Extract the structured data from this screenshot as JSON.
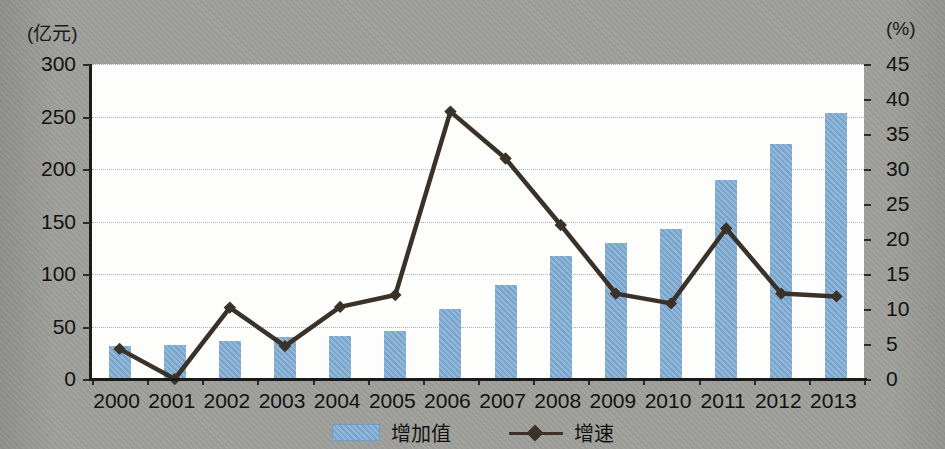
{
  "axis": {
    "left_unit": "(亿元)",
    "right_unit": "(%)",
    "left_ticks": [
      "300",
      "250",
      "200",
      "150",
      "100",
      "50",
      "0"
    ],
    "right_ticks": [
      "45",
      "40",
      "35",
      "30",
      "25",
      "20",
      "15",
      "10",
      "5",
      "0"
    ]
  },
  "legend": {
    "bar_label": "增加值",
    "line_label": "增速"
  },
  "colors": {
    "bar": "#7facd4",
    "line": "#3a3229",
    "grid": "#9ab0c4",
    "background": "#a0a09b",
    "plot_background": "#fdfdfb",
    "text": "#111111"
  },
  "chart_data": {
    "type": "bar",
    "title": "",
    "subtitle": "",
    "xlabel": "",
    "ylabel": "(亿元)",
    "y2label": "(%)",
    "grid": true,
    "legend_position": "bottom",
    "ylim": [
      0,
      300
    ],
    "y2lim": [
      0,
      45
    ],
    "ytick_step": 50,
    "y2tick_step": 5,
    "categories": [
      "2000",
      "2001",
      "2002",
      "2003",
      "2004",
      "2005",
      "2006",
      "2007",
      "2008",
      "2009",
      "2010",
      "2011",
      "2012",
      "2013"
    ],
    "series": [
      {
        "name": "增加值",
        "type": "bar",
        "axis": "left",
        "unit": "亿元",
        "values": [
          31,
          32,
          36,
          40,
          41,
          46,
          67,
          90,
          117,
          130,
          143,
          190,
          224,
          253
        ]
      },
      {
        "name": "增速",
        "type": "line",
        "axis": "right",
        "unit": "%",
        "marker": "diamond",
        "values": [
          4.3,
          0.0,
          10.2,
          4.7,
          10.3,
          12.0,
          38.2,
          31.5,
          22.0,
          12.2,
          10.8,
          21.5,
          12.2,
          11.8
        ]
      }
    ]
  }
}
